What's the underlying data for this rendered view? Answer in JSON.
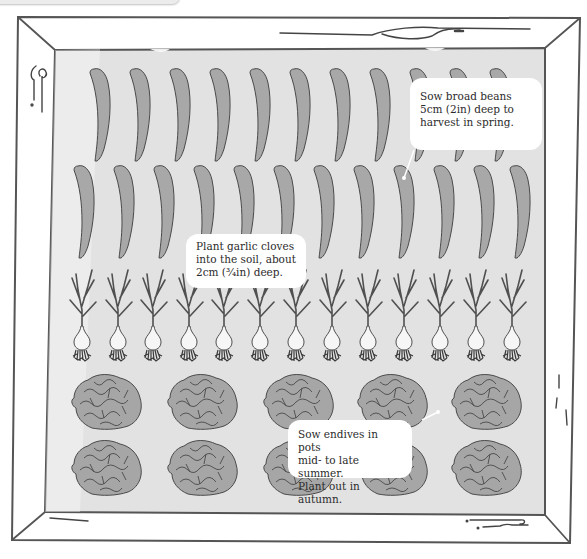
{
  "illustration": {
    "subject": "Vegetable bed planting plan",
    "colors": {
      "soil": "#e2e2e2",
      "frame_line": "#555555",
      "frame_fill": "#ffffff",
      "plant_fill": "#a8a8a8",
      "plant_line": "#4a4a4a",
      "bulb_fill": "#f4f4f4",
      "callout_bg": "#ffffff",
      "callout_text": "#2b2b2b"
    },
    "rows": [
      {
        "crop": "broad beans",
        "count": 11
      },
      {
        "crop": "broad beans",
        "count": 12
      },
      {
        "crop": "garlic",
        "count": 13
      },
      {
        "crop": "endives",
        "count": 5
      },
      {
        "crop": "endives",
        "count": 5
      }
    ]
  },
  "callouts": {
    "broad_beans": "Sow broad beans\n5cm (2in) deep to\nharvest in spring.",
    "garlic": "Plant garlic cloves\ninto the soil, about\n2cm (³⁄₄in) deep.",
    "endives": "Sow endives in pots\nmid- to late summer.\nPlant out in autumn."
  }
}
